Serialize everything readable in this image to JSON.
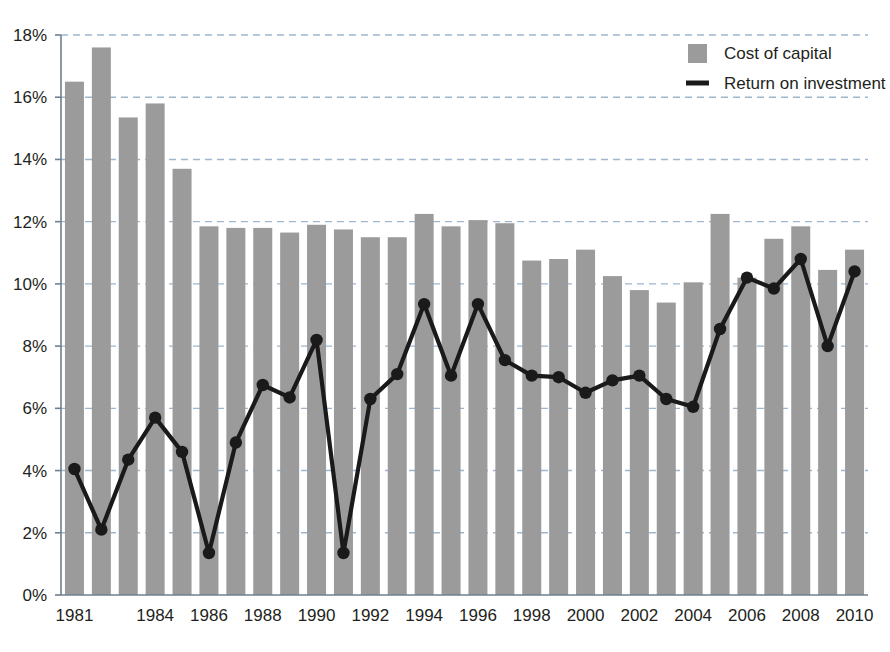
{
  "chart_data": {
    "type": "bar",
    "title": "",
    "xlabel": "",
    "ylabel": "",
    "ylim": [
      0,
      18
    ],
    "ytick_values": [
      0,
      2,
      4,
      6,
      8,
      10,
      12,
      14,
      16,
      18
    ],
    "ytick_labels": [
      "0%",
      "2%",
      "4%",
      "6%",
      "8%",
      "10%",
      "12%",
      "14%",
      "16%",
      "18%"
    ],
    "grid": true,
    "grid_style": "dashed-horizontal",
    "legend_position": "top-right",
    "categories": [
      "1981",
      "1982",
      "1983",
      "1984",
      "1985",
      "1986",
      "1987",
      "1988",
      "1989",
      "1990",
      "1991",
      "1992",
      "1993",
      "1994",
      "1995",
      "1996",
      "1997",
      "1998",
      "1999",
      "2000",
      "2001",
      "2002",
      "2003",
      "2004",
      "2005",
      "2006",
      "2007",
      "2008",
      "2009",
      "2010"
    ],
    "xtick_labels_shown": [
      "1981",
      "1984",
      "1986",
      "1988",
      "1990",
      "1992",
      "1994",
      "1996",
      "1998",
      "2000",
      "2002",
      "2004",
      "2006",
      "2008",
      "2010"
    ],
    "series": [
      {
        "name": "Cost of capital",
        "kind": "bar",
        "color": "#9b9b9b",
        "values": [
          16.5,
          17.6,
          15.35,
          15.8,
          13.7,
          11.85,
          11.8,
          11.8,
          11.65,
          11.9,
          11.75,
          11.5,
          11.5,
          12.25,
          11.85,
          12.05,
          11.95,
          10.75,
          10.8,
          11.1,
          10.25,
          9.8,
          9.4,
          10.05,
          12.25,
          10.2,
          11.45,
          11.85,
          10.45,
          11.1
        ]
      },
      {
        "name": "Return on investment",
        "kind": "line",
        "color": "#1a1a1a",
        "values": [
          4.05,
          2.1,
          4.35,
          5.7,
          4.6,
          1.35,
          4.9,
          6.75,
          6.35,
          8.2,
          1.35,
          6.3,
          7.1,
          9.35,
          7.05,
          9.35,
          7.55,
          7.05,
          7.0,
          6.5,
          6.9,
          7.05,
          6.3,
          6.05,
          8.55,
          10.2,
          9.85,
          10.8,
          8.0,
          10.4
        ]
      }
    ],
    "legend": [
      {
        "label": "Cost of capital",
        "marker": "square-swatch",
        "color": "#9b9b9b"
      },
      {
        "label": "Return on investment",
        "marker": "line-swatch",
        "color": "#1a1a1a"
      }
    ],
    "colors": {
      "bar": "#9b9b9b",
      "line": "#1a1a1a",
      "grid": "#9fb6cf",
      "axis": "#6f7f8f",
      "text": "#231f20",
      "background": "#ffffff"
    }
  }
}
